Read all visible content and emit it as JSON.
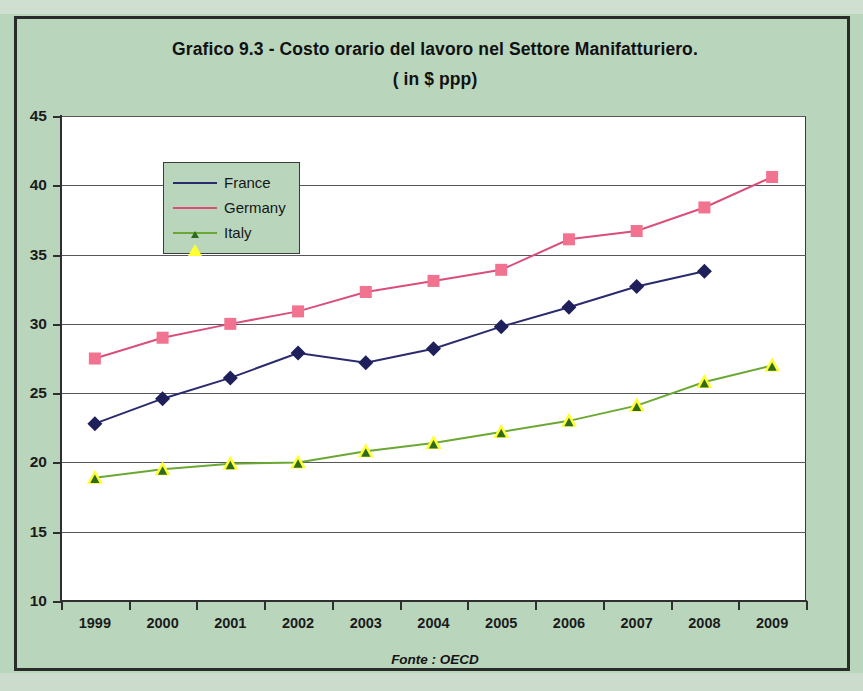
{
  "figure": {
    "title_line1": "Grafico 9.3 -  Costo orario del lavoro nel Settore Manifatturiero.",
    "title_line2": "( in $ ppp)",
    "source_note": "Fonte : OECD"
  },
  "chart_data": {
    "type": "line",
    "title": "Grafico 9.3 -  Costo orario del lavoro nel Settore Manifatturiero. ( in $ ppp)",
    "subtitle": "( in $ ppp)",
    "xlabel": "",
    "ylabel": "",
    "source": "Fonte : OECD",
    "categories": [
      "1999",
      "2000",
      "2001",
      "2002",
      "2003",
      "2004",
      "2005",
      "2006",
      "2007",
      "2008",
      "2009"
    ],
    "ylim": [
      10,
      45
    ],
    "yticks": [
      "10",
      "15",
      "20",
      "25",
      "30",
      "35",
      "40",
      "45"
    ],
    "ytick_values": [
      10,
      15,
      20,
      25,
      30,
      35,
      40,
      45
    ],
    "grid": true,
    "legend_position": "upper-left-inside",
    "series": [
      {
        "name": "France",
        "color": "#2a2a6e",
        "marker": "diamond",
        "marker_color": "#1f1f5c",
        "values": [
          22.8,
          24.6,
          26.1,
          27.9,
          27.2,
          28.2,
          29.8,
          31.2,
          32.7,
          33.8,
          null
        ]
      },
      {
        "name": "Germany",
        "color": "#d94f7a",
        "marker": "square",
        "marker_color": "#f2738f",
        "values": [
          27.5,
          29.0,
          30.0,
          30.9,
          32.3,
          33.1,
          33.9,
          36.1,
          36.7,
          38.4,
          40.6
        ]
      },
      {
        "name": "Italy",
        "color": "#6aa832",
        "marker": "triangle",
        "marker_color": "#ffff33",
        "values": [
          18.9,
          19.5,
          19.9,
          20.0,
          20.8,
          21.4,
          22.2,
          23.0,
          24.1,
          25.8,
          27.0
        ]
      }
    ]
  }
}
